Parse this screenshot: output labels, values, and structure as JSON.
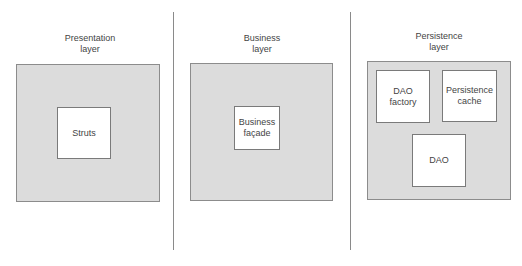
{
  "diagram": {
    "layers": [
      {
        "title_line1": "Presentation",
        "title_line2": "layer",
        "components": [
          {
            "label": "Struts"
          }
        ]
      },
      {
        "title_line1": "Business",
        "title_line2": "layer",
        "components": [
          {
            "label": "Business\nfaçade"
          }
        ]
      },
      {
        "title_line1": "Persistence",
        "title_line2": "layer",
        "components": [
          {
            "label": "DAO\nfactory"
          },
          {
            "label": "Persistence\ncache"
          },
          {
            "label": "DAO"
          }
        ]
      }
    ],
    "colors": {
      "layer_fill": "#dcdcdc",
      "layer_border": "#8c8c8c",
      "component_fill": "#ffffff",
      "divider": "#8a8a8a"
    }
  }
}
